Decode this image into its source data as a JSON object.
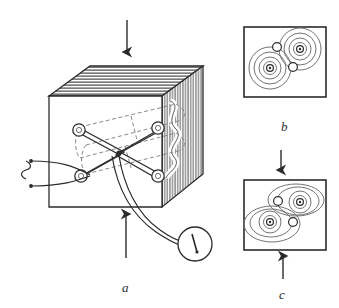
{
  "figure": {
    "type": "scientific-line-diagram",
    "style": "monochrome ink drawing on white",
    "panels": [
      {
        "id": "a",
        "label": "a",
        "name": "panel-a-apparatus",
        "description": "Hatched solid cube containing a crossed four-electrode array, driven by an AC source and read out by a pointer meter; vertical force arrows press on top and bottom faces.",
        "components": [
          {
            "name": "force-arrow-top",
            "direction": "down",
            "meaning": "applied compressive force"
          },
          {
            "name": "force-arrow-bottom",
            "direction": "up",
            "meaning": "reaction compressive force"
          },
          {
            "name": "specimen-cube",
            "faces": [
              "front-plain",
              "top-hatched-horizontal",
              "right-hatched-vertical"
            ]
          },
          {
            "name": "internal-cavity",
            "style": "dashed outline"
          },
          {
            "name": "electrode-node",
            "count": 4,
            "arrangement": "X cross"
          },
          {
            "name": "ac-source",
            "symbol": "sine"
          },
          {
            "name": "meter",
            "readout": "needle pointer"
          }
        ]
      },
      {
        "id": "b",
        "label": "b",
        "name": "panel-b-unstressed-field",
        "description": "Field/equipotential contour map in the unstressed state: two circular concentric ring clusters with dotted centers, plus two small plain circles.",
        "clusters": [
          {
            "name": "cluster-upper-right",
            "rings": 4,
            "shape": "circular",
            "center": "dotted"
          },
          {
            "name": "cluster-lower-left",
            "rings": 4,
            "shape": "circular",
            "center": "dotted"
          }
        ],
        "plain_circles": 2
      },
      {
        "id": "c",
        "label": "c",
        "name": "panel-c-stressed-field",
        "description": "Field/equipotential contour map under load: the same two clusters but with outer contours flattened into ellipses, indicating deformation.",
        "clusters": [
          {
            "name": "cluster-upper-right",
            "rings": 4,
            "shape": "elliptical-outer",
            "center": "dotted"
          },
          {
            "name": "cluster-lower-left",
            "rings": 4,
            "shape": "elliptical-outer",
            "center": "dotted"
          }
        ],
        "plain_circles": 2,
        "force_arrow": {
          "name": "force-arrow-panel-c",
          "direction": "up"
        }
      }
    ],
    "connectors": [
      {
        "name": "arrow-b-to-c",
        "direction": "down",
        "meaning": "transition from unstressed to stressed state"
      }
    ],
    "colors": {
      "ink": "#2b2b2b",
      "hatch": "#5a5a5a",
      "dash": "#7a7a7a",
      "contour": "#6b6b6b",
      "paper": "#ffffff"
    }
  }
}
